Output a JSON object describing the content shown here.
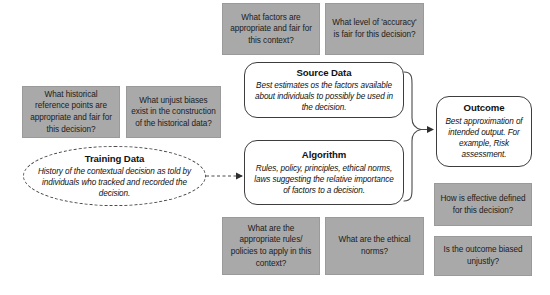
{
  "diagram": {
    "colors": {
      "question_box_fill": "#a9a9a9",
      "question_box_text": "#1b1b1b",
      "node_border": "#3d3d3d",
      "node_fill": "#ffffff",
      "connector": "#4a4a4a"
    },
    "nodes": [
      {
        "id": "training-data",
        "title": "Training Data",
        "body": "History of the contextual decision as told by individuals who tracked and recorded the decision.",
        "border_style": "dashed"
      },
      {
        "id": "source-data",
        "title": "Source Data",
        "body": "Best estimates os the factors available about individuals to possibly be used in the decision.",
        "border_style": "solid"
      },
      {
        "id": "algorithm",
        "title": "Algorithm",
        "body": "Rules, policy, principles, ethical norms, laws suggesting the relative importance of factors to a decision.",
        "border_style": "solid"
      },
      {
        "id": "outcome",
        "title": "Outcome",
        "body": "Best approximation of intended output. For example, Risk assessment.",
        "border_style": "solid"
      }
    ],
    "questions": [
      {
        "id": "factors-appropriate-fair",
        "text": "What factors are appropriate and fair for this context?"
      },
      {
        "id": "accuracy-level-fair",
        "text": "What level of 'accuracy' is fair for this decision?"
      },
      {
        "id": "historical-reference-points",
        "text": "What historical reference points are appropriate and fair for this decision?"
      },
      {
        "id": "unjust-biases-historical-data",
        "text": "What unjust biases exist in the construction of the historical data?"
      },
      {
        "id": "appropriate-rules-policies",
        "text": "What are the appropriate rules/ policies to apply in this context?"
      },
      {
        "id": "ethical-norms",
        "text": "What are the ethical norms?"
      },
      {
        "id": "effective-defined",
        "text": "How is effective defined for this decision?"
      },
      {
        "id": "outcome-biased-unjustly",
        "text": "Is the outcome biased unjustly?"
      }
    ]
  }
}
